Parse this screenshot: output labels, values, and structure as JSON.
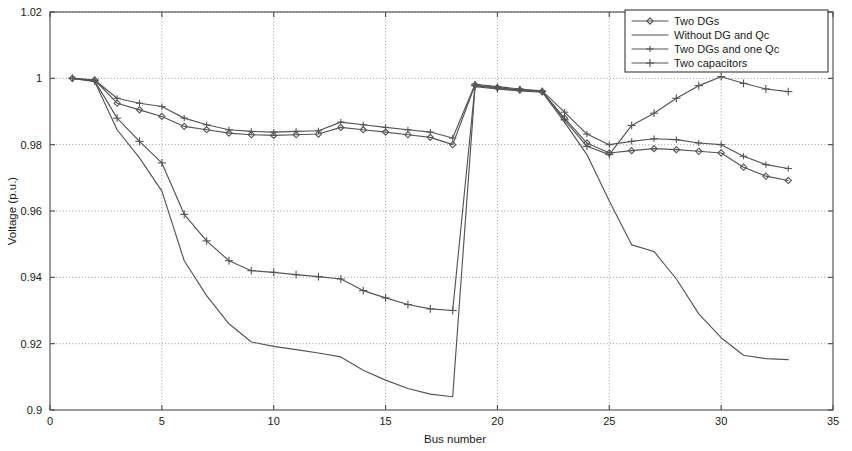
{
  "chart_data": {
    "type": "line",
    "title": "",
    "xlabel": "Bus number",
    "ylabel": "Voltage (p.u.)",
    "xlim": [
      0,
      35
    ],
    "ylim": [
      0.9,
      1.02
    ],
    "xticks": [
      0,
      5,
      10,
      15,
      20,
      25,
      30,
      35
    ],
    "xtick_labels": [
      "0",
      "5",
      "10",
      "15",
      "20",
      "25",
      "30",
      "35"
    ],
    "yticks": [
      0.9,
      0.92,
      0.94,
      0.96,
      0.98,
      1,
      1.02
    ],
    "ytick_labels": [
      "0.9",
      "0.92",
      "0.94",
      "0.96",
      "0.98",
      "1",
      "1.02"
    ],
    "grid": true,
    "grid_style": "dotted",
    "legend_position": "top-right",
    "x": [
      1,
      2,
      3,
      4,
      5,
      6,
      7,
      8,
      9,
      10,
      11,
      12,
      13,
      14,
      15,
      16,
      17,
      18,
      19,
      20,
      21,
      22,
      23,
      24,
      25,
      26,
      27,
      28,
      29,
      30,
      31,
      32,
      33
    ],
    "series": [
      {
        "name": "Two DGs",
        "marker": "diamond",
        "color": "#555555",
        "values": [
          1.0,
          0.9995,
          0.9925,
          0.9905,
          0.9885,
          0.9855,
          0.9845,
          0.9835,
          0.983,
          0.9828,
          0.983,
          0.9832,
          0.9852,
          0.9845,
          0.9838,
          0.983,
          0.9822,
          0.98,
          0.998,
          0.9972,
          0.9965,
          0.996,
          0.988,
          0.9805,
          0.9775,
          0.9782,
          0.9788,
          0.9785,
          0.978,
          0.9775,
          0.9732,
          0.9705,
          0.9692
        ]
      },
      {
        "name": "Without DG and Qc",
        "marker": "none",
        "color": "#555555",
        "values": [
          1.0,
          0.999,
          0.9845,
          0.976,
          0.966,
          0.945,
          0.9345,
          0.926,
          0.9205,
          0.9192,
          0.9182,
          0.9172,
          0.916,
          0.912,
          0.909,
          0.9065,
          0.9048,
          0.904,
          0.9975,
          0.9968,
          0.9962,
          0.9958,
          0.9868,
          0.977,
          0.963,
          0.9498,
          0.9478,
          0.9395,
          0.929,
          0.9218,
          0.9165,
          0.9155,
          0.9152
        ]
      },
      {
        "name": "Two DGs and one Qc",
        "marker": "plus",
        "color": "#555555",
        "values": [
          1.0,
          0.9995,
          0.994,
          0.9925,
          0.9915,
          0.988,
          0.986,
          0.9845,
          0.984,
          0.9838,
          0.984,
          0.9842,
          0.9868,
          0.986,
          0.9852,
          0.9845,
          0.9838,
          0.982,
          0.9982,
          0.9975,
          0.9968,
          0.9962,
          0.9898,
          0.9832,
          0.98,
          0.981,
          0.9818,
          0.9815,
          0.9805,
          0.98,
          0.9765,
          0.974,
          0.9728
        ]
      },
      {
        "name": "Two capacitors",
        "marker": "plus-cross",
        "color": "#555555",
        "values": [
          1.0,
          0.9992,
          0.988,
          0.981,
          0.9745,
          0.959,
          0.951,
          0.945,
          0.942,
          0.9415,
          0.9408,
          0.9402,
          0.9395,
          0.936,
          0.9338,
          0.9318,
          0.9305,
          0.93,
          0.9978,
          0.997,
          0.9965,
          0.996,
          0.9875,
          0.9795,
          0.977,
          0.9858,
          0.9895,
          0.994,
          0.9978,
          1.0005,
          0.9985,
          0.9968,
          0.996
        ]
      }
    ]
  },
  "axes": {
    "ylabel": "Voltage (p.u.)",
    "xlabel": "Bus number"
  },
  "legend": {
    "items": [
      {
        "label": "Two DGs"
      },
      {
        "label": "Without DG and Qc"
      },
      {
        "label": "Two DGs and one Qc"
      },
      {
        "label": "Two capacitors"
      }
    ]
  }
}
